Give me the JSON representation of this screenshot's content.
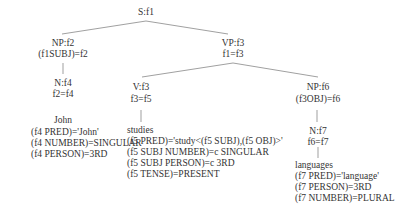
{
  "tree": {
    "root": {
      "label": "S:f1"
    },
    "np_subj": {
      "label": "NP:f2",
      "eq": "(f1SUBJ)=f2"
    },
    "n_john": {
      "label": "N:f4",
      "eq": "f2=f4",
      "word": "John",
      "features": [
        "(f4 PRED)='John'",
        "(f4 NUMBER)=SINGULAR",
        "(f4 PERSON)=3RD"
      ]
    },
    "vp": {
      "label": "VP:f3",
      "eq": "f1=f3"
    },
    "v": {
      "label": "V:f3",
      "eq": "f3=f5",
      "word": "studies",
      "features": [
        "(f5 PRED)='study<(f5 SUBJ),(f5 OBJ)>'",
        "(f5 SUBJ NUMBER)=c SINGULAR",
        "(f5 SUBJ PERSON)=c 3RD",
        "(f5 TENSE)=PRESENT"
      ]
    },
    "np_obj": {
      "label": "NP:f6",
      "eq": "(f3OBJ)=f6"
    },
    "n_lang": {
      "label": "N:f7",
      "eq": "f6=f7",
      "word": "languages",
      "features": [
        "(f7 PRED)='language'",
        "(f7 PERSON)=3RD",
        "(f7 NUMBER)=PLURAL"
      ]
    }
  }
}
